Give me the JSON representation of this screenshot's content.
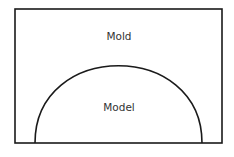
{
  "diagram": {
    "labels": {
      "mold": "Mold",
      "model": "Model"
    },
    "colors": {
      "stroke": "#1a1a1a",
      "text": "#333333",
      "background": "#ffffff"
    }
  }
}
